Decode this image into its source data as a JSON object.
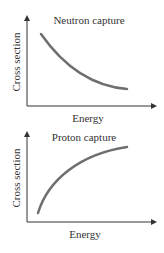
{
  "panels": [
    {
      "title": "Neutron capture",
      "xlabel": "Energy",
      "ylabel": "Cross section",
      "trend": "decreasing"
    },
    {
      "title": "Proton capture",
      "xlabel": "Energy",
      "ylabel": "Cross section",
      "trend": "increasing"
    }
  ],
  "colors": {
    "curve": "#6e6e6e",
    "axis": "#333333",
    "text": "#333333"
  }
}
